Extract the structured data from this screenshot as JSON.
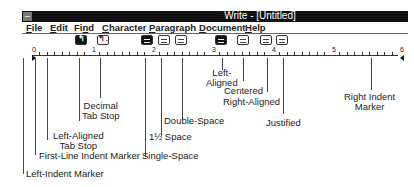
{
  "window": {
    "title": "Write - [Untitled]",
    "menu": [
      {
        "label": "File",
        "accel": "F"
      },
      {
        "label": "Edit",
        "accel": "E"
      },
      {
        "label": "Find",
        "accel": "n"
      },
      {
        "label": "Character",
        "accel": "C"
      },
      {
        "label": "Paragraph",
        "accel": "P"
      },
      {
        "label": "Document",
        "accel": "D"
      },
      {
        "label": "Help",
        "accel": "H"
      }
    ]
  },
  "ruler": {
    "numbers": [
      "0",
      "1",
      "2",
      "3",
      "4",
      "5",
      "6"
    ],
    "icons": [
      {
        "name": "left-aligned-tab-icon",
        "glyph": "↰",
        "active": true
      },
      {
        "name": "decimal-tab-icon",
        "glyph": "↰.",
        "active": false
      },
      {
        "name": "single-space-icon",
        "active": true
      },
      {
        "name": "one-half-space-icon",
        "active": false
      },
      {
        "name": "double-space-icon",
        "active": false
      },
      {
        "name": "left-aligned-icon",
        "active": true
      },
      {
        "name": "centered-icon",
        "active": false
      },
      {
        "name": "right-aligned-icon",
        "active": false
      },
      {
        "name": "justified-icon",
        "active": false
      }
    ]
  },
  "callouts": {
    "decimal_tab_l1": "Decimal",
    "decimal_tab_l2": "Tab Stop",
    "left_tab_l1": "Left-Aligned",
    "left_tab_l2": "Tab Stop",
    "first_line": "First-Line Indent Marker",
    "left_indent": "Left-Indent Marker",
    "single_space": "Single-Space",
    "one_half_space": "1½ Space",
    "double_space": "Double-Space",
    "left_aligned_l1": "Left-",
    "left_aligned_l2": "Aligned",
    "centered": "Centered",
    "right_aligned": "Right-Aligned",
    "justified": "Justified",
    "right_indent_l1": "Right Indent",
    "right_indent_l2": "Marker"
  }
}
